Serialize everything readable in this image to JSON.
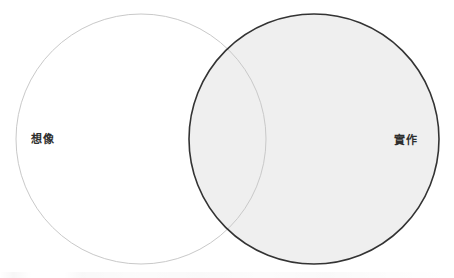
{
  "diagram": {
    "type": "venn",
    "canvas": {
      "width": 454,
      "height": 278,
      "background": "#ffffff"
    },
    "sets": [
      {
        "id": "imagination",
        "label": "想像",
        "label_position": "left-interior",
        "fill": "#ffffff",
        "stroke": "#c9c9c9",
        "stroke_width": 1,
        "center_x": 141,
        "center_y": 139,
        "radius": 125
      },
      {
        "id": "practice",
        "label": "實作",
        "label_position": "right-interior",
        "fill": "#efefef",
        "stroke": "#333333",
        "stroke_width": 1.6,
        "center_x": 314,
        "center_y": 139,
        "radius": 125
      }
    ],
    "overlap": {
      "fill": "#efefef",
      "label": ""
    }
  }
}
